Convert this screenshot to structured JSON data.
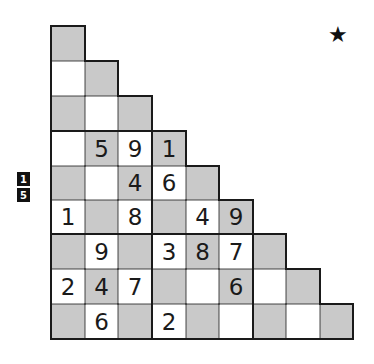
{
  "puzzle": {
    "type": "staircase-sudoku",
    "icon": "star-icon",
    "star_glyph": "★",
    "badges": [
      "1",
      "5"
    ],
    "colors": {
      "gray": "#c9c9c9",
      "white": "#ffffff",
      "line": "#1a1a1a"
    },
    "rows": [
      [
        {
          "c": "G",
          "v": ""
        }
      ],
      [
        {
          "c": "W",
          "v": ""
        },
        {
          "c": "G",
          "v": ""
        }
      ],
      [
        {
          "c": "G",
          "v": ""
        },
        {
          "c": "W",
          "v": ""
        },
        {
          "c": "G",
          "v": ""
        }
      ],
      [
        {
          "c": "W",
          "v": ""
        },
        {
          "c": "G",
          "v": "5"
        },
        {
          "c": "W",
          "v": "9"
        },
        {
          "c": "G",
          "v": "1"
        }
      ],
      [
        {
          "c": "G",
          "v": ""
        },
        {
          "c": "W",
          "v": ""
        },
        {
          "c": "G",
          "v": "4"
        },
        {
          "c": "W",
          "v": "6"
        },
        {
          "c": "G",
          "v": ""
        }
      ],
      [
        {
          "c": "W",
          "v": "1"
        },
        {
          "c": "G",
          "v": ""
        },
        {
          "c": "W",
          "v": "8"
        },
        {
          "c": "G",
          "v": ""
        },
        {
          "c": "W",
          "v": "4"
        },
        {
          "c": "G",
          "v": "9"
        }
      ],
      [
        {
          "c": "G",
          "v": ""
        },
        {
          "c": "W",
          "v": "9"
        },
        {
          "c": "G",
          "v": ""
        },
        {
          "c": "W",
          "v": "3"
        },
        {
          "c": "G",
          "v": "8"
        },
        {
          "c": "W",
          "v": "7"
        },
        {
          "c": "G",
          "v": ""
        }
      ],
      [
        {
          "c": "W",
          "v": "2"
        },
        {
          "c": "G",
          "v": "4"
        },
        {
          "c": "W",
          "v": "7"
        },
        {
          "c": "G",
          "v": ""
        },
        {
          "c": "W",
          "v": ""
        },
        {
          "c": "G",
          "v": "6"
        },
        {
          "c": "W",
          "v": ""
        },
        {
          "c": "G",
          "v": ""
        }
      ],
      [
        {
          "c": "G",
          "v": ""
        },
        {
          "c": "W",
          "v": "6"
        },
        {
          "c": "G",
          "v": ""
        },
        {
          "c": "W",
          "v": "2"
        },
        {
          "c": "G",
          "v": ""
        },
        {
          "c": "W",
          "v": ""
        },
        {
          "c": "G",
          "v": ""
        },
        {
          "c": "W",
          "v": ""
        },
        {
          "c": "G",
          "v": ""
        }
      ]
    ]
  }
}
